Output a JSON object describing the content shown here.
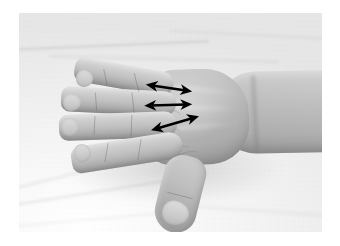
{
  "figure": {
    "domain": "natural-image",
    "kind": "clinical-photograph",
    "rendering": "grayscale",
    "caption_text": "",
    "label_text": "",
    "canvas": {
      "width": 340,
      "height": 246,
      "background": "#ffffff"
    },
    "photo_frame": {
      "x": 19,
      "y": 13,
      "width": 303,
      "height": 219
    }
  },
  "colors": {
    "page_background": "#ffffff",
    "sheet_light": "#fbfbfa",
    "sheet_mid": "#ececeb",
    "sheet_shadow": "#dedede",
    "skin_highlight": "#ded7d1",
    "skin_mid": "#c5bcb5",
    "skin_shadow": "#a0958d",
    "annotation": "#000000"
  },
  "anatomy": {
    "parts": [
      {
        "name": "index-finger",
        "label": "index finger"
      },
      {
        "name": "middle-finger",
        "label": "middle finger"
      },
      {
        "name": "ring-finger",
        "label": "ring finger"
      },
      {
        "name": "little-finger",
        "label": "little finger"
      },
      {
        "name": "thumb",
        "label": "thumb"
      },
      {
        "name": "dorsum",
        "label": "dorsum of hand"
      },
      {
        "name": "forearm",
        "label": "forearm"
      },
      {
        "name": "wrist",
        "label": "wrist"
      }
    ]
  },
  "annotations": {
    "style": {
      "stroke": "#000000",
      "stroke_width": 2.6,
      "head": "double",
      "head_length": 7
    },
    "count": 3,
    "arrows": [
      {
        "name": "arrow-web-space-1",
        "label": "first web space",
        "x1": 152,
        "y1": 85.5,
        "x2": 186,
        "y2": 90.5
      },
      {
        "name": "arrow-web-space-2",
        "label": "second web space",
        "x1": 150.5,
        "y1": 105.5,
        "x2": 186,
        "y2": 104.5
      },
      {
        "name": "arrow-web-space-3",
        "label": "third web space",
        "x1": 157,
        "y1": 128.5,
        "x2": 193,
        "y2": 118
      }
    ]
  },
  "sheet_features": {
    "folds": [
      {
        "name": "fold-upper-left"
      },
      {
        "name": "fold-upper-mid"
      },
      {
        "name": "fold-upper-right"
      },
      {
        "name": "fold-lower-left-a"
      },
      {
        "name": "fold-lower-left-b"
      },
      {
        "name": "fold-lower-left-c"
      },
      {
        "name": "fold-lower-right"
      }
    ]
  }
}
